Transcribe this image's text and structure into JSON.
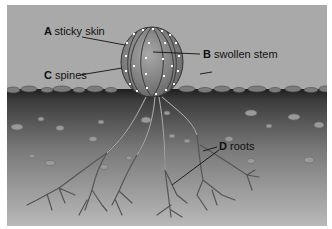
{
  "diagram": {
    "labels": [
      {
        "letter": "A",
        "text": "sticky skin"
      },
      {
        "letter": "B",
        "text": "swollen stem"
      },
      {
        "letter": "C",
        "text": "spines"
      },
      {
        "letter": "D",
        "text": "roots"
      }
    ],
    "colors": {
      "sky": "#a9a9a9",
      "soil_top": "#3a3a3a",
      "soil_bottom": "#b4b4b4",
      "cactus_body": "#8a8a8a",
      "spine_dots": "#ffffff"
    }
  }
}
